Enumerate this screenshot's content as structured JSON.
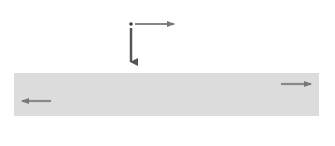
{
  "diagram": {
    "colors": {
      "background": "#ffffff",
      "wire_band": "#dcdcdc",
      "loops": "#8a8a8a",
      "arrows": "#777777",
      "force_arrow": "#555555",
      "text": "#444444"
    },
    "charge": {
      "label": "q",
      "x": 131,
      "y": 24
    },
    "velocity_u": {
      "label": "u",
      "direction": "right"
    },
    "force": {
      "label_main": "F",
      "label_sub": "B",
      "direction": "down"
    },
    "field": {
      "label": "B"
    },
    "velocity_positive": {
      "label": "v",
      "direction": "right"
    },
    "velocity_negative": {
      "label": "v",
      "direction": "left"
    },
    "wire": {
      "x": 14,
      "y": 73,
      "width": 305,
      "height": 43
    },
    "loops_cx": [
      82,
      115,
      148,
      180,
      213,
      245
    ],
    "plus_x": [
      62,
      85,
      107,
      131,
      154,
      177,
      199,
      222,
      246,
      268
    ],
    "minus_x": [
      62,
      85,
      107,
      131,
      154,
      177,
      199,
      222,
      246,
      268
    ],
    "plus_sign": "+",
    "minus_sign": "–"
  }
}
